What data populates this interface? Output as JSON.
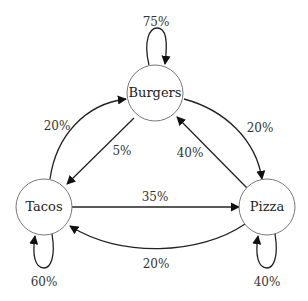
{
  "diagram": {
    "type": "markov-chain",
    "nodes": [
      {
        "id": "burgers",
        "label": "Burgers"
      },
      {
        "id": "tacos",
        "label": "Tacos"
      },
      {
        "id": "pizza",
        "label": "Pizza"
      }
    ],
    "edges": [
      {
        "from": "burgers",
        "to": "burgers",
        "label": "75%"
      },
      {
        "from": "burgers",
        "to": "pizza",
        "label": "20%"
      },
      {
        "from": "burgers",
        "to": "tacos",
        "label": "5%"
      },
      {
        "from": "tacos",
        "to": "tacos",
        "label": "60%"
      },
      {
        "from": "tacos",
        "to": "burgers",
        "label": "20%"
      },
      {
        "from": "tacos",
        "to": "pizza",
        "label": "35%"
      },
      {
        "from": "pizza",
        "to": "pizza",
        "label": "40%"
      },
      {
        "from": "pizza",
        "to": "burgers",
        "label": "40%"
      },
      {
        "from": "pizza",
        "to": "tacos",
        "label": "20%"
      }
    ]
  }
}
